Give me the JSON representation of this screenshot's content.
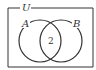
{
  "diagram": {
    "type": "venn",
    "universe_label": "U",
    "sets": [
      {
        "name": "A",
        "label": "A"
      },
      {
        "name": "B",
        "label": "B"
      }
    ],
    "regions": {
      "intersection": "2"
    },
    "colors": {
      "stroke": "#333333",
      "background": "#ffffff"
    }
  }
}
